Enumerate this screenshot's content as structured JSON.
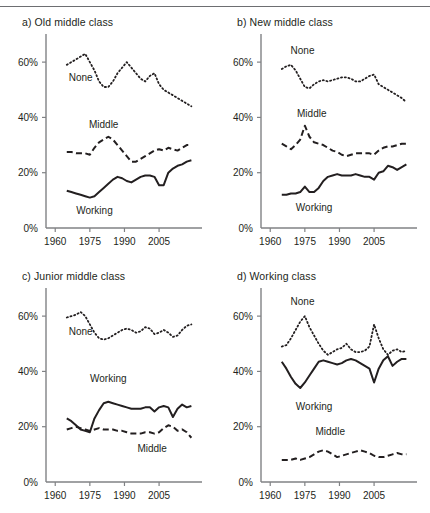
{
  "figure": {
    "top_rule": true,
    "caption": ""
  },
  "axes": {
    "y_ticks": [
      "0%",
      "20%",
      "40%",
      "60%"
    ],
    "y_tick_values": [
      0,
      20,
      40,
      60
    ],
    "x_ticks": [
      "1960",
      "1975",
      "1990",
      "2005"
    ],
    "x_tick_values": [
      1960,
      1975,
      1990,
      2005
    ],
    "xlim": [
      1956,
      2021
    ],
    "ylim": [
      0,
      68
    ]
  },
  "series_labels": {
    "none": "None",
    "middle": "Middle",
    "working": "Working"
  },
  "chart_data": [
    {
      "type": "line",
      "panel": "a",
      "title": "a) Old middle class",
      "xlabel": "",
      "ylabel": "",
      "xlim": [
        1956,
        2021
      ],
      "ylim": [
        0,
        68
      ],
      "xticks": [
        1960,
        1975,
        1990,
        2005
      ],
      "yticks": [
        0,
        20,
        40,
        60
      ],
      "grid": false,
      "legend_position": "inline-annotation",
      "x": [
        1965,
        1967,
        1969,
        1971,
        1973,
        1975,
        1977,
        1979,
        1981,
        1983,
        1985,
        1987,
        1989,
        1991,
        1993,
        1995,
        1997,
        1999,
        2001,
        2003,
        2005,
        2007,
        2009,
        2011,
        2013,
        2015,
        2017,
        2019
      ],
      "series": [
        {
          "name": "None",
          "style": "dotted",
          "values": [
            59,
            60,
            61,
            62,
            63,
            60,
            57,
            53,
            51,
            51,
            53,
            56,
            58,
            60,
            58,
            56,
            54,
            53,
            55,
            56,
            52,
            50,
            49,
            48,
            47,
            46,
            45,
            44
          ]
        },
        {
          "name": "Middle",
          "style": "dashed",
          "values": [
            27.5,
            27.5,
            27,
            27,
            27,
            26.5,
            29,
            31,
            32,
            33,
            32,
            30,
            28,
            26,
            24,
            24,
            25,
            26,
            27,
            28,
            28.5,
            28,
            29,
            28.5,
            28,
            29,
            30,
            30
          ]
        },
        {
          "name": "Working",
          "style": "solid",
          "values": [
            13.5,
            13,
            12.5,
            12,
            11.5,
            11,
            11.5,
            13,
            14.5,
            16,
            17.5,
            18.5,
            18,
            17,
            16.5,
            17.5,
            18.5,
            19,
            19,
            18.5,
            15.5,
            15.5,
            20,
            21.5,
            22.5,
            23,
            24,
            24.5
          ]
        }
      ],
      "annotations": [
        {
          "text": "None",
          "x": 1971,
          "y": 53
        },
        {
          "text": "Middle",
          "x": 1981,
          "y": 36
        },
        {
          "text": "Working",
          "x": 1977,
          "y": 5
        }
      ]
    },
    {
      "type": "line",
      "panel": "b",
      "title": "b) New middle class",
      "xlabel": "",
      "ylabel": "",
      "xlim": [
        1956,
        2021
      ],
      "ylim": [
        0,
        68
      ],
      "xticks": [
        1960,
        1975,
        1990,
        2005
      ],
      "yticks": [
        0,
        20,
        40,
        60
      ],
      "grid": false,
      "legend_position": "inline-annotation",
      "x": [
        1965,
        1967,
        1969,
        1971,
        1973,
        1975,
        1977,
        1979,
        1981,
        1983,
        1985,
        1987,
        1989,
        1991,
        1993,
        1995,
        1997,
        1999,
        2001,
        2003,
        2005,
        2007,
        2009,
        2011,
        2013,
        2015,
        2017,
        2019
      ],
      "series": [
        {
          "name": "None",
          "style": "dotted",
          "values": [
            57.5,
            58.5,
            59,
            57,
            54,
            51,
            50.5,
            52,
            53,
            53.5,
            53,
            53.5,
            54,
            54.5,
            54.5,
            54,
            53,
            53,
            54,
            55,
            55.5,
            52,
            51,
            50,
            49,
            48,
            47,
            45.5
          ]
        },
        {
          "name": "Middle",
          "style": "dashed",
          "values": [
            30.5,
            29.5,
            28.5,
            30,
            32,
            37,
            33,
            31,
            30.5,
            30,
            29,
            28,
            27.5,
            26.5,
            26,
            26.5,
            27,
            27,
            27,
            27,
            26.5,
            28,
            29,
            29.5,
            29.5,
            30,
            30.5,
            30.5
          ]
        },
        {
          "name": "Working",
          "style": "solid",
          "values": [
            12,
            12,
            12.5,
            12.5,
            13,
            15,
            13,
            13,
            14.5,
            17,
            18.5,
            19,
            19.5,
            19,
            19,
            19,
            19.5,
            19,
            18.5,
            18.5,
            17.5,
            20,
            20.5,
            22.5,
            22,
            21,
            22,
            23
          ]
        }
      ],
      "annotations": [
        {
          "text": "None",
          "x": 1974,
          "y": 63
        },
        {
          "text": "Middle",
          "x": 1978,
          "y": 40
        },
        {
          "text": "Working",
          "x": 1979,
          "y": 6
        }
      ]
    },
    {
      "type": "line",
      "panel": "c",
      "title": "c) Junior middle class",
      "xlabel": "",
      "ylabel": "",
      "xlim": [
        1956,
        2021
      ],
      "ylim": [
        0,
        68
      ],
      "xticks": [
        1960,
        1975,
        1990,
        2005
      ],
      "yticks": [
        0,
        20,
        40,
        60
      ],
      "grid": false,
      "legend_position": "inline-annotation",
      "x": [
        1965,
        1967,
        1969,
        1971,
        1973,
        1975,
        1977,
        1979,
        1981,
        1983,
        1985,
        1987,
        1989,
        1991,
        1993,
        1995,
        1997,
        1999,
        2001,
        2003,
        2005,
        2007,
        2009,
        2011,
        2013,
        2015,
        2017,
        2019
      ],
      "series": [
        {
          "name": "None",
          "style": "dotted",
          "values": [
            59.5,
            60,
            60.5,
            61.5,
            60,
            57,
            54,
            52,
            51.5,
            52,
            53,
            54,
            55,
            55.5,
            55,
            54,
            54.5,
            56,
            55.5,
            53.5,
            54,
            55,
            54,
            52.5,
            53,
            55,
            56.5,
            57
          ]
        },
        {
          "name": "Middle",
          "style": "dashed",
          "values": [
            19,
            19.5,
            20,
            19.5,
            19,
            18.5,
            19,
            19.5,
            19,
            19,
            19,
            18.5,
            18.5,
            18,
            17.5,
            17.5,
            17.5,
            18,
            18,
            17.5,
            18,
            19.5,
            20.5,
            20,
            18.5,
            19,
            18,
            16
          ]
        },
        {
          "name": "Working",
          "style": "solid",
          "values": [
            23,
            22,
            20.5,
            19,
            18.5,
            18,
            23,
            26,
            28.5,
            29,
            28.5,
            28,
            27.5,
            27,
            26.5,
            26.5,
            26.5,
            27,
            27,
            25.5,
            27,
            27.5,
            27,
            23.5,
            26.5,
            28,
            27,
            27.5
          ]
        }
      ],
      "annotations": [
        {
          "text": "None",
          "x": 1971,
          "y": 53
        },
        {
          "text": "Working",
          "x": 1983,
          "y": 36
        },
        {
          "text": "Middle",
          "x": 2002,
          "y": 11
        }
      ]
    },
    {
      "type": "line",
      "panel": "d",
      "title": "d) Working class",
      "xlabel": "",
      "ylabel": "",
      "xlim": [
        1956,
        2021
      ],
      "ylim": [
        0,
        68
      ],
      "xticks": [
        1960,
        1975,
        1990,
        2005
      ],
      "yticks": [
        0,
        20,
        40,
        60
      ],
      "grid": false,
      "legend_position": "inline-annotation",
      "x": [
        1965,
        1967,
        1969,
        1971,
        1973,
        1975,
        1977,
        1979,
        1981,
        1983,
        1985,
        1987,
        1989,
        1991,
        1993,
        1995,
        1997,
        1999,
        2001,
        2003,
        2005,
        2007,
        2009,
        2011,
        2013,
        2015,
        2017,
        2019
      ],
      "series": [
        {
          "name": "None",
          "style": "dotted",
          "values": [
            49,
            49.5,
            52,
            55,
            58,
            60,
            56,
            53,
            50,
            47.5,
            46,
            47,
            48,
            48.5,
            50,
            48,
            47,
            47,
            47.5,
            49,
            57,
            52,
            48,
            46,
            47.5,
            48,
            47,
            47.5
          ]
        },
        {
          "name": "Middle",
          "style": "dashed",
          "values": [
            8,
            8,
            8,
            8.5,
            8,
            8.5,
            9,
            10,
            11,
            11.5,
            11,
            10,
            9,
            9.5,
            10,
            10.5,
            11,
            11.5,
            11,
            10.5,
            9.5,
            9,
            9,
            9.5,
            10,
            10.5,
            10,
            10
          ]
        },
        {
          "name": "Working",
          "style": "solid",
          "values": [
            43.5,
            41,
            38,
            35.5,
            34,
            36,
            38.5,
            41,
            43.5,
            44,
            43.5,
            43,
            42.5,
            43,
            44,
            44.5,
            44,
            43,
            42,
            41,
            36,
            41,
            44,
            45.5,
            42,
            43.5,
            44.5,
            44.5
          ]
        }
      ],
      "annotations": [
        {
          "text": "None",
          "x": 1974,
          "y": 64
        },
        {
          "text": "Working",
          "x": 1979,
          "y": 26
        },
        {
          "text": "Middle",
          "x": 1986,
          "y": 17
        }
      ]
    }
  ]
}
